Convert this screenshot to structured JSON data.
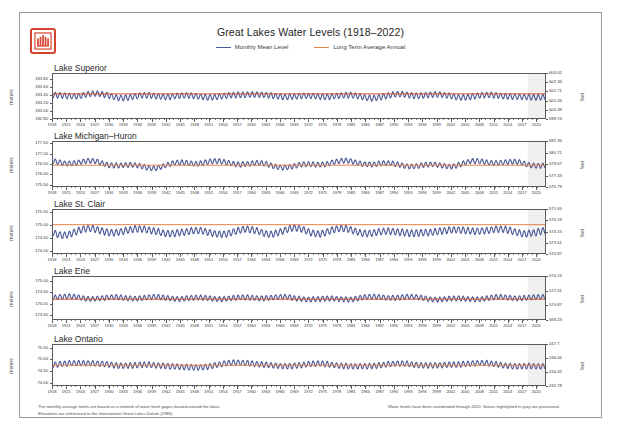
{
  "header": {
    "title": "Great Lakes Water Levels (1918–2022)",
    "logo_icon": "usace-castle-icon",
    "legend": [
      {
        "label": "Monthly Mean Level",
        "color": "#4a5899",
        "key": "monthly-mean-level"
      },
      {
        "label": "Long Term Average Annual",
        "color": "#e8834a",
        "key": "long-term-average-annual"
      }
    ]
  },
  "axis_units": {
    "left": "meters",
    "right": "feet"
  },
  "footer": {
    "left": "The monthly average levels are based on a network of water level gages located around the lakes.\nElevations are referenced to the International Great Lakes Datum (1985).",
    "right": "Water levels have been coordinated through 2020.  Values highlighted in gray are provisional."
  },
  "x_axis": {
    "start_year": 1918,
    "end_year": 2022,
    "tick_step": 3,
    "labels": [
      "1918",
      "1921",
      "1924",
      "1927",
      "1930",
      "1933",
      "1936",
      "1939",
      "1942",
      "1945",
      "1948",
      "1951",
      "1954",
      "1957",
      "1960",
      "1963",
      "1966",
      "1969",
      "1972",
      "1975",
      "1978",
      "1981",
      "1984",
      "1987",
      "1990",
      "1993",
      "1996",
      "1999",
      "2002",
      "2005",
      "2008",
      "2011",
      "2014",
      "2017",
      "2020"
    ]
  },
  "chart_data": [
    {
      "type": "line",
      "title": "Lake Superior",
      "xlabel": "",
      "ylabel": "meters",
      "ylabel_right": "feet",
      "xlim": [
        1918,
        2022
      ],
      "ylim": [
        182.8,
        183.95
      ],
      "ylim_right": [
        599.74,
        603.52
      ],
      "grid": false,
      "yticks": [
        "183.80",
        "183.60",
        "183.40",
        "183.20",
        "183.00",
        "182.80"
      ],
      "ytick_values": [
        183.8,
        183.6,
        183.4,
        183.2,
        183.0,
        182.8
      ],
      "yticks_right": [
        "603.02",
        "602.36",
        "601.71",
        "601.05",
        "600.39",
        "599.74"
      ],
      "ytick_values_right": [
        603.02,
        602.36,
        601.71,
        601.05,
        600.39,
        599.74
      ],
      "series": [
        {
          "name": "Monthly Mean Level",
          "color": "#4a5899",
          "seed": 11,
          "amplitude": 0.13,
          "drift": 0.14
        },
        {
          "name": "Long Term Average Annual",
          "color": "#d4512e",
          "type": "hline",
          "value": 183.43
        }
      ]
    },
    {
      "type": "line",
      "title": "Lake Michigan–Huron",
      "xlabel": "",
      "ylabel": "meters",
      "ylabel_right": "feet",
      "xlim": [
        1918,
        2022
      ],
      "ylim": [
        175.4,
        177.6
      ],
      "ylim_right": [
        575.79,
        582.35
      ],
      "grid": false,
      "yticks": [
        "177.50",
        "177.00",
        "176.50",
        "176.00",
        "175.50"
      ],
      "ytick_values": [
        177.5,
        177.0,
        176.5,
        176.0,
        175.5
      ],
      "yticks_right": [
        "582.35",
        "580.71",
        "579.07",
        "577.43",
        "575.79"
      ],
      "ytick_values_right": [
        582.35,
        580.71,
        579.07,
        577.43,
        575.79
      ],
      "series": [
        {
          "name": "Monthly Mean Level",
          "color": "#4a5899",
          "seed": 23,
          "amplitude": 0.22,
          "drift": 0.52
        },
        {
          "name": "Long Term Average Annual",
          "color": "#e8834a",
          "type": "hline",
          "value": 176.44
        }
      ]
    },
    {
      "type": "line",
      "title": "Lake St. Clair",
      "xlabel": "",
      "ylabel": "meters",
      "ylabel_right": "feet",
      "xlim": [
        1918,
        2022
      ],
      "ylim": [
        173.9,
        175.6
      ],
      "ylim_right": [
        570.87,
        571.65
      ],
      "grid": false,
      "yticks": [
        "175.50",
        "175.00",
        "174.50",
        "174.00"
      ],
      "ytick_values": [
        175.5,
        175.0,
        174.5,
        174.0
      ],
      "yticks_right": [
        "571.65",
        "575.19",
        "574.15",
        "573.51",
        "570.87"
      ],
      "ytick_values_right": [
        571.65,
        575.19,
        574.15,
        573.51,
        570.87
      ],
      "series": [
        {
          "name": "Monthly Mean Level",
          "color": "#4a5899",
          "seed": 37,
          "amplitude": 0.23,
          "drift": 0.36
        },
        {
          "name": "Long Term Average Annual",
          "color": "#e8834a",
          "type": "hline",
          "value": 175.02
        }
      ]
    },
    {
      "type": "line",
      "title": "Lake Erie",
      "xlabel": "",
      "ylabel": "meters",
      "ylabel_right": "feet",
      "xlim": [
        1918,
        2022
      ],
      "ylim": [
        173.3,
        175.2
      ],
      "ylim_right": [
        569.23,
        574.15
      ],
      "grid": false,
      "yticks": [
        "175.00",
        "174.50",
        "174.00",
        "173.50"
      ],
      "ytick_values": [
        175.0,
        174.5,
        174.0,
        173.5
      ],
      "yticks_right": [
        "574.15",
        "572.51",
        "570.87",
        "569.23"
      ],
      "ytick_values_right": [
        574.15,
        572.51,
        570.87,
        569.23
      ],
      "series": [
        {
          "name": "Monthly Mean Level",
          "color": "#4a5899",
          "seed": 53,
          "amplitude": 0.2,
          "drift": 0.34
        },
        {
          "name": "Long Term Average Annual",
          "color": "#d4512e",
          "type": "hline",
          "value": 174.2
        }
      ]
    },
    {
      "type": "line",
      "title": "Lake Ontario",
      "xlabel": "",
      "ylabel": "meters",
      "ylabel_right": "feet",
      "xlim": [
        1918,
        2022
      ],
      "ylim": [
        73.85,
        75.65
      ],
      "ylim_right": [
        242.78,
        247.7
      ],
      "grid": false,
      "yticks": [
        "75.50",
        "75.00",
        "74.50",
        "74.00"
      ],
      "ytick_values": [
        75.5,
        75.0,
        74.5,
        74.0
      ],
      "yticks_right": [
        "247.7",
        "246.06",
        "244.42",
        "242.78"
      ],
      "ytick_values_right": [
        247.7,
        246.06,
        244.42,
        242.78
      ],
      "series": [
        {
          "name": "Monthly Mean Level",
          "color": "#4a5899",
          "seed": 71,
          "amplitude": 0.22,
          "drift": 0.3
        },
        {
          "name": "Long Term Average Annual",
          "color": "#e8834a",
          "type": "hline",
          "value": 74.74
        }
      ]
    }
  ]
}
